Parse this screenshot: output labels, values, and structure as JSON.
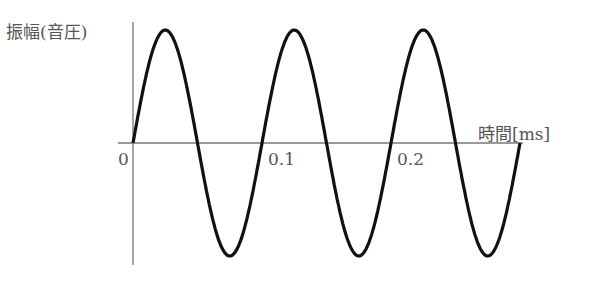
{
  "chart_data": {
    "type": "line",
    "title": "",
    "xlabel": "時間[ms]",
    "ylabel": "振幅(音圧)",
    "x_ticks": [
      "0",
      "0.1",
      "0.2"
    ],
    "series": [
      {
        "name": "sine wave",
        "function": "sin",
        "cycles": 3,
        "period_ms": 0.1,
        "x_range_ms": [
          0,
          0.3
        ]
      }
    ],
    "grid": false,
    "legend": "none"
  },
  "labels": {
    "ylabel": "振幅(音圧)",
    "xlabel": "時間[ms]",
    "tick0": "0",
    "tick1": "0.1",
    "tick2": "0.2"
  }
}
